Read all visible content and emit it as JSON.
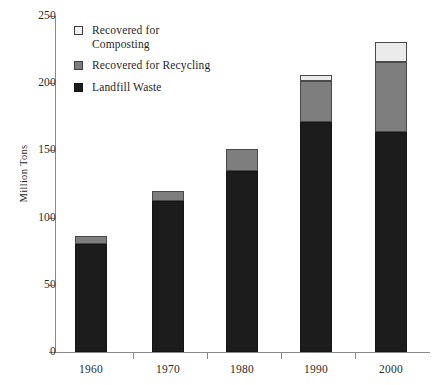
{
  "chart_data": {
    "type": "bar",
    "stacked": true,
    "title": "",
    "subtitle": "",
    "xlabel": "",
    "ylabel": "Million Tons",
    "categories": [
      "1960",
      "1970",
      "1980",
      "1990",
      "2000"
    ],
    "ylim": [
      0,
      250
    ],
    "yticks": [
      0,
      50,
      100,
      150,
      200,
      250
    ],
    "ytick_labels": [
      "0",
      "50",
      "100",
      "150",
      "200",
      "250"
    ],
    "grid": false,
    "legend_position": "upper-left-inside",
    "series": [
      {
        "name": "Landfill Waste",
        "color": "#1c1c1c",
        "values": [
          80,
          112,
          135,
          171,
          164
        ]
      },
      {
        "name": "Recovered for Recycling",
        "color": "#7e7e7e",
        "values": [
          6,
          8,
          16,
          31,
          52
        ]
      },
      {
        "name": "Recovered for Composting",
        "color": "#ebebeb",
        "values": [
          0,
          0,
          0,
          4,
          15
        ]
      }
    ],
    "totals": [
      86,
      120,
      151,
      206,
      231
    ],
    "annotations": []
  },
  "legend": {
    "items": [
      {
        "label": "Recovered for Composting",
        "swatch_class": "sw-composting",
        "name": "composting"
      },
      {
        "label": "Recovered for Recycling",
        "swatch_class": "sw-recycling",
        "name": "recycling"
      },
      {
        "label": "Landfill Waste",
        "swatch_class": "sw-landfill",
        "name": "landfill"
      }
    ]
  }
}
